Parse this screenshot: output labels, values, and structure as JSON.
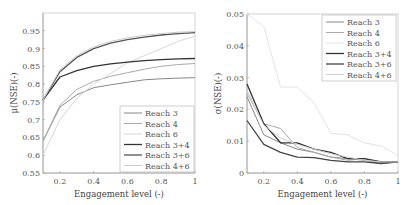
{
  "chart_data": [
    {
      "type": "line",
      "title": "",
      "xlabel": "Engagement level (-)",
      "ylabel": "μ(NSE)(-)",
      "xlim": [
        0.1,
        1.0
      ],
      "ylim": [
        0.55,
        1.0
      ],
      "xticks": [
        "0.2",
        "0.4",
        "0.6",
        "0.8",
        "1"
      ],
      "yticks": [
        "0.55",
        "0.6",
        "0.65",
        "0.7",
        "0.75",
        "0.8",
        "0.85",
        "0.9",
        "0.95"
      ],
      "grid": false,
      "legend_position": "lower right",
      "x": [
        0.1,
        0.2,
        0.3,
        0.4,
        0.5,
        0.6,
        0.7,
        0.8,
        0.9,
        1.0
      ],
      "series": [
        {
          "name": "Reach 3",
          "color": "#888888",
          "width": 1,
          "values": [
            0.64,
            0.735,
            0.77,
            0.79,
            0.798,
            0.805,
            0.812,
            0.815,
            0.817,
            0.818
          ]
        },
        {
          "name": "Reach 4",
          "color": "#aaaaaa",
          "width": 1,
          "values": [
            0.64,
            0.74,
            0.785,
            0.808,
            0.822,
            0.832,
            0.842,
            0.85,
            0.855,
            0.858
          ]
        },
        {
          "name": "Reach 6",
          "color": "#d8d8d8",
          "width": 1,
          "values": [
            0.6,
            0.7,
            0.76,
            0.8,
            0.83,
            0.86,
            0.88,
            0.9,
            0.92,
            0.935
          ]
        },
        {
          "name": "Reach 3+4",
          "color": "#333333",
          "width": 1.3,
          "values": [
            0.755,
            0.82,
            0.838,
            0.85,
            0.857,
            0.862,
            0.866,
            0.869,
            0.871,
            0.872
          ]
        },
        {
          "name": "Reach 3+6",
          "color": "#555555",
          "width": 1.3,
          "values": [
            0.755,
            0.835,
            0.875,
            0.9,
            0.915,
            0.925,
            0.932,
            0.938,
            0.942,
            0.945
          ]
        },
        {
          "name": "Reach 4+6",
          "color": "#cccccc",
          "width": 1,
          "values": [
            0.755,
            0.84,
            0.88,
            0.905,
            0.92,
            0.93,
            0.937,
            0.942,
            0.946,
            0.948
          ]
        }
      ]
    },
    {
      "type": "line",
      "title": "",
      "xlabel": "Engagement level (-)",
      "ylabel": "σ(NSE)(-)",
      "xlim": [
        0.1,
        1.0
      ],
      "ylim": [
        0,
        0.05
      ],
      "xticks": [
        "0.2",
        "0.4",
        "0.6",
        "0.8",
        "1"
      ],
      "yticks": [
        "0",
        "0.01",
        "0.02",
        "0.03",
        "0.04",
        "0.05"
      ],
      "grid": false,
      "legend_position": "upper right",
      "x": [
        0.1,
        0.2,
        0.3,
        0.4,
        0.5,
        0.6,
        0.7,
        0.8,
        0.9,
        1.0
      ],
      "series": [
        {
          "name": "Reach 3",
          "color": "#888888",
          "width": 1,
          "values": [
            0.024,
            0.012,
            0.0095,
            0.0075,
            0.0065,
            0.005,
            0.0045,
            0.004,
            0.003,
            0.0035
          ]
        },
        {
          "name": "Reach 4",
          "color": "#aaaaaa",
          "width": 1,
          "values": [
            0.025,
            0.0155,
            0.014,
            0.008,
            0.0065,
            0.005,
            0.004,
            0.0045,
            0.0035,
            0.0035
          ]
        },
        {
          "name": "Reach 6",
          "color": "#e4e4e4",
          "width": 1,
          "values": [
            0.05,
            0.046,
            0.027,
            0.027,
            0.022,
            0.0125,
            0.012,
            0.0095,
            0.0085,
            0.0055
          ]
        },
        {
          "name": "Reach 3+4",
          "color": "#333333",
          "width": 1.3,
          "values": [
            0.028,
            0.0155,
            0.0095,
            0.0095,
            0.0075,
            0.0065,
            0.0045,
            0.0045,
            0.0035,
            0.0035
          ]
        },
        {
          "name": "Reach 3+6",
          "color": "#444444",
          "width": 1.3,
          "values": [
            0.0165,
            0.009,
            0.0065,
            0.005,
            0.0048,
            0.004,
            0.0035,
            0.0035,
            0.003,
            0.0035
          ]
        },
        {
          "name": "Reach 4+6",
          "color": "#d0d0d0",
          "width": 1,
          "values": [
            0.026,
            0.015,
            0.011,
            0.009,
            0.0075,
            0.006,
            0.005,
            0.004,
            0.0035,
            0.0035
          ]
        }
      ]
    }
  ]
}
